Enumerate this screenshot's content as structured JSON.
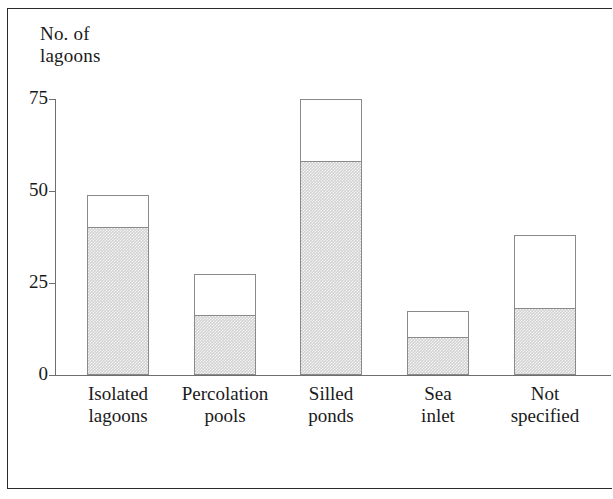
{
  "figure": {
    "axis_title": "No. of\nlagoons",
    "frame_color": "#2b2b2b",
    "axis_color": "#6e6e6e",
    "bar_outline_color": "#8a8a8a",
    "shaded_fill_color": "#d2d2d2",
    "unshaded_fill_color": "#ffffff"
  },
  "chart_data": {
    "type": "bar",
    "title": "",
    "subtitle": "",
    "xlabel": "",
    "ylabel": "No. of lagoons",
    "ylim": [
      0,
      75
    ],
    "yticks": [
      0,
      25,
      50,
      75
    ],
    "ytick_labels": [
      "0",
      "25",
      "50",
      "75"
    ],
    "grid": false,
    "legend": false,
    "legend_position": "none",
    "stacked": true,
    "categories": [
      "Isolated\nlagoons",
      "Percolation\npools",
      "Silled\nponds",
      "Sea\ninlet",
      "Not\nspecified"
    ],
    "category_labels_flat": [
      "Isolated lagoons",
      "Percolation pools",
      "Silled ponds",
      "Sea inlet",
      "Not specified"
    ],
    "series": [
      {
        "name": "shaded",
        "fill": "shaded",
        "values": [
          40,
          16,
          58,
          10,
          18
        ]
      },
      {
        "name": "unshaded",
        "fill": "white",
        "values": [
          9,
          11.5,
          17,
          7.5,
          20
        ]
      }
    ],
    "totals": [
      49,
      27.5,
      75,
      17.5,
      38
    ]
  },
  "bars": [
    {
      "label": "Isolated\nlagoons",
      "x": 32,
      "width": 62,
      "total": 49,
      "shaded": 40
    },
    {
      "label": "Percolation\npools",
      "x": 139,
      "width": 62,
      "total": 27.5,
      "shaded": 16
    },
    {
      "label": "Silled\nponds",
      "x": 245,
      "width": 62,
      "total": 75,
      "shaded": 58
    },
    {
      "label": "Sea\ninlet",
      "x": 352,
      "width": 62,
      "total": 17.5,
      "shaded": 10
    },
    {
      "label": "Not\nspecified",
      "x": 459,
      "width": 62,
      "total": 38,
      "shaded": 18
    }
  ],
  "yticks": [
    {
      "label": "75",
      "value": 75
    },
    {
      "label": "50",
      "value": 50
    },
    {
      "label": "25",
      "value": 25
    },
    {
      "label": "0",
      "value": 0
    }
  ]
}
